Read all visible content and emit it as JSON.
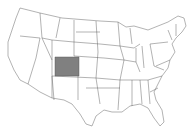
{
  "map": {
    "region": "United States",
    "highlighted_state": "Colorado",
    "highlight_color": "#808080",
    "base_color": "#ffffff",
    "border_color": "#555555"
  }
}
